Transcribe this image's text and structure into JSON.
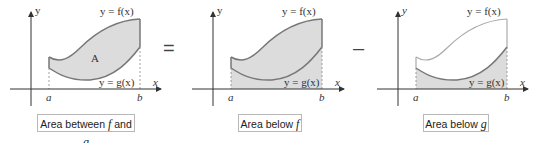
{
  "figure": {
    "equation_operators": {
      "equals": "=",
      "minus": "–"
    },
    "panels": [
      {
        "id": "between",
        "caption_prefix": "Area between ",
        "caption_var1": "f",
        "caption_mid": " and ",
        "caption_var2": "g",
        "region_label": "A",
        "f_label": "y = f(x)",
        "g_label": "y = g(x)",
        "a_label": "a",
        "b_label": "b",
        "x_axis": "x",
        "y_axis": "y"
      },
      {
        "id": "below-f",
        "caption_prefix": "Area below ",
        "caption_var1": "f",
        "f_label": "y = f(x)",
        "g_label": "y = g(x)",
        "a_label": "a",
        "b_label": "b",
        "x_axis": "x",
        "y_axis": "y"
      },
      {
        "id": "below-g",
        "caption_prefix": "Area below ",
        "caption_var1": "g",
        "f_label": "y = f(x)",
        "g_label": "y = g(x)",
        "a_label": "a",
        "b_label": "b",
        "x_axis": "x",
        "y_axis": "y"
      }
    ],
    "colors": {
      "fill": "#dcdcdc",
      "curve": "#777777",
      "axis": "#333333"
    }
  }
}
